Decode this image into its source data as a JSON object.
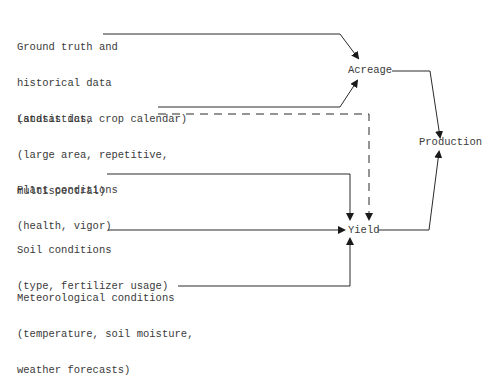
{
  "inputs": {
    "ground_truth": {
      "line1": "Ground truth and",
      "line2": "historical data",
      "line3": "(statistics, crop calendar)"
    },
    "landsat": {
      "line1": "Landsat data",
      "line2": "(large area, repetitive,",
      "line3": "multispectral)"
    },
    "plant": {
      "line1": "Plant conditions",
      "line2": "(health, vigor)"
    },
    "soil": {
      "line1": "Soil conditions",
      "line2": "(type, fertilizer usage)"
    },
    "meteorological": {
      "line1": "Meteorological conditions",
      "line2": "(temperature, soil moisture,",
      "line3": "weather forecasts)"
    }
  },
  "nodes": {
    "acreage": "Acreage",
    "yield": "Yield",
    "production": "Production"
  },
  "edges": [
    {
      "from": "ground_truth",
      "to": "acreage",
      "style": "solid"
    },
    {
      "from": "landsat",
      "to": "acreage",
      "style": "solid"
    },
    {
      "from": "landsat",
      "to": "yield",
      "style": "dashed"
    },
    {
      "from": "plant",
      "to": "yield",
      "style": "solid"
    },
    {
      "from": "soil",
      "to": "yield",
      "style": "solid"
    },
    {
      "from": "meteorological",
      "to": "yield",
      "style": "solid"
    },
    {
      "from": "acreage",
      "to": "production",
      "style": "solid"
    },
    {
      "from": "yield",
      "to": "production",
      "style": "solid"
    }
  ]
}
